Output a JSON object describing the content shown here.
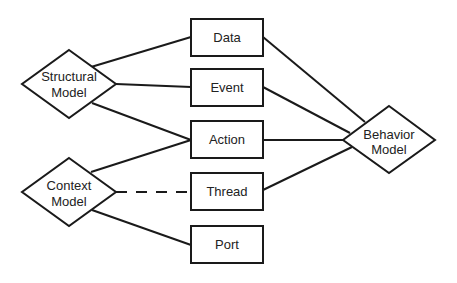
{
  "diagram": {
    "nodes": {
      "structural": {
        "line1": "Structural",
        "line2": "Model",
        "shape": "diamond"
      },
      "context": {
        "line1": "Context",
        "line2": "Model",
        "shape": "diamond"
      },
      "behavior": {
        "line1": "Behavior",
        "line2": "Model",
        "shape": "diamond"
      },
      "data": {
        "label": "Data",
        "shape": "rectangle"
      },
      "event": {
        "label": "Event",
        "shape": "rectangle"
      },
      "action": {
        "label": "Action",
        "shape": "rectangle"
      },
      "thread": {
        "label": "Thread",
        "shape": "rectangle"
      },
      "port": {
        "label": "Port",
        "shape": "rectangle"
      }
    },
    "edges": [
      {
        "from": "Structural Model",
        "to": "Data",
        "style": "solid"
      },
      {
        "from": "Structural Model",
        "to": "Event",
        "style": "solid"
      },
      {
        "from": "Structural Model",
        "to": "Action",
        "style": "solid"
      },
      {
        "from": "Context Model",
        "to": "Action",
        "style": "solid"
      },
      {
        "from": "Context Model",
        "to": "Thread",
        "style": "dashed"
      },
      {
        "from": "Context Model",
        "to": "Port",
        "style": "solid"
      },
      {
        "from": "Data",
        "to": "Behavior Model",
        "style": "solid"
      },
      {
        "from": "Event",
        "to": "Behavior Model",
        "style": "solid"
      },
      {
        "from": "Action",
        "to": "Behavior Model",
        "style": "solid"
      },
      {
        "from": "Thread",
        "to": "Behavior Model",
        "style": "solid"
      }
    ],
    "colors": {
      "stroke": "#1a1a1a",
      "text": "#222222",
      "background": "#ffffff"
    }
  }
}
